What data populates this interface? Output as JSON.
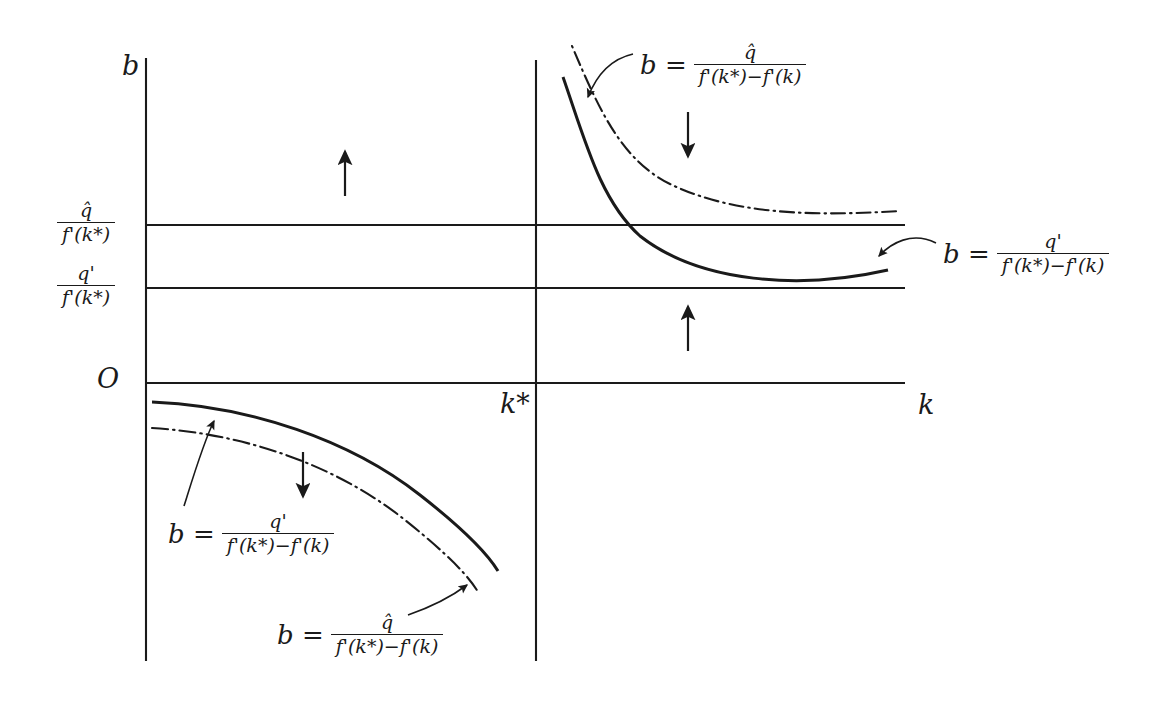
{
  "figure": {
    "type": "phase-diagram",
    "background": "#ffffff",
    "ink_color": "#1a1a1a",
    "width": 1164,
    "height": 701
  },
  "axes": {
    "vertical_axis_label": "b",
    "horizontal_axis_label": "k",
    "origin_label": "O",
    "steady_state_label": "k*",
    "vertical_axis_x": 146,
    "vertical_axis_y_top": 58,
    "vertical_axis_y_bottom": 661,
    "horizontal_axis_y": 383,
    "horizontal_axis_x_left": 146,
    "horizontal_axis_x_right": 905,
    "kstar_line_x": 536,
    "kstar_line_y_top": 60,
    "kstar_line_y_bottom": 661
  },
  "horizontal_levels": [
    {
      "id": "q-hat-level",
      "y": 225,
      "x_start": 146,
      "x_end": 905,
      "label_numerator": "q̂",
      "label_denominator": "f'(k*)"
    },
    {
      "id": "q-prime-level",
      "y": 288,
      "x_start": 146,
      "x_end": 905,
      "label_numerator": "q'",
      "label_denominator": "f'(k*)"
    }
  ],
  "curve_labels": {
    "top_right": {
      "lead": "b =",
      "numerator": "q̂",
      "denominator": "f'(k*)−f'(k)",
      "x": 640,
      "y": 42,
      "points_to": "upper-right-dashed-curve"
    },
    "right": {
      "lead": "b =",
      "numerator": "q'",
      "denominator": "f'(k*)−f'(k)",
      "x": 943,
      "y": 238,
      "points_to": "upper-right-solid-curve"
    },
    "bottom_left": {
      "lead": "b =",
      "numerator": "q'",
      "denominator": "f'(k*)−f'(k)",
      "x": 168,
      "y": 518,
      "points_to": "lower-left-solid-curve"
    },
    "bottom_center": {
      "lead": "b =",
      "numerator": "q̂",
      "denominator": "f'(k*)−f'(k)",
      "x": 277,
      "y": 619,
      "points_to": "lower-left-dotted-curve"
    }
  },
  "direction_arrows": [
    {
      "id": "arrow-upper-left",
      "direction": "up",
      "x": 345,
      "y_tail": 196,
      "y_head": 150
    },
    {
      "id": "arrow-upper-right-down",
      "direction": "down",
      "x": 688,
      "y_tail": 112,
      "y_head": 158
    },
    {
      "id": "arrow-middle-right-up",
      "direction": "up",
      "x": 688,
      "y_tail": 351,
      "y_head": 305
    },
    {
      "id": "arrow-lower-left-down",
      "direction": "down",
      "x": 303,
      "y_tail": 452,
      "y_head": 498
    }
  ],
  "curves": [
    {
      "id": "upper-right-solid-curve",
      "quadrant": "upper-right",
      "style": "solid",
      "represents": "b = q' / (f'(k*) - f'(k))",
      "path": "M 563,77 C 585,140 600,200 640,236 C 700,283 800,290 888,270"
    },
    {
      "id": "upper-right-dashed-curve",
      "quadrant": "upper-right",
      "style": "dash-dot",
      "represents": "b = q-hat / (f'(k*) - f'(k))",
      "path": "M 572,46 C 600,112 622,160 670,184 C 740,218 830,215 900,211"
    },
    {
      "id": "lower-left-solid-curve",
      "quadrant": "lower-left",
      "style": "solid",
      "represents": "b = q' / (f'(k*) - f'(k))",
      "path": "M 152,402 C 250,406 350,440 420,495 C 466,531 487,553 498,571"
    },
    {
      "id": "lower-left-dotted-curve",
      "quadrant": "lower-left",
      "style": "dash-dot",
      "represents": "b = q-hat / (f'(k*) - f'(k))",
      "path": "M 152,428 C 250,434 340,468 405,520 C 450,556 470,578 478,592"
    }
  ],
  "pointer_arrows": [
    {
      "id": "pointer-top-right",
      "path": "M 632,54 C 610,60 596,74 587,96",
      "head": [
        583,
        105
      ]
    },
    {
      "id": "pointer-right",
      "path": "M 934,243 C 910,232 890,244 880,256",
      "head": [
        873,
        262
      ]
    },
    {
      "id": "pointer-bottom-left",
      "path": "M 185,505 C 196,470 205,440 215,420",
      "head": [
        219,
        412
      ]
    },
    {
      "id": "pointer-bottom-center",
      "path": "M 410,614 C 432,606 452,596 468,584",
      "head": [
        476,
        578
      ]
    }
  ]
}
